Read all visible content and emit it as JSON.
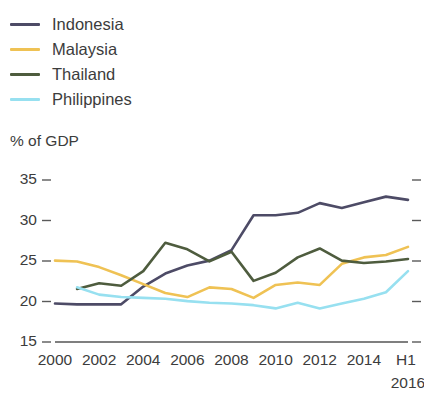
{
  "legend": {
    "position": "top-left",
    "items": [
      {
        "label": "Indonesia",
        "color": "#4d4b66",
        "icon": "line-swatch-icon"
      },
      {
        "label": "Malaysia",
        "color": "#efc254",
        "icon": "line-swatch-icon"
      },
      {
        "label": "Thailand",
        "color": "#4e5c3e",
        "icon": "line-swatch-icon"
      },
      {
        "label": "Philippines",
        "color": "#97e0f0",
        "icon": "line-swatch-icon"
      }
    ]
  },
  "axis": {
    "y_title": "% of GDP",
    "y_ticks": [
      "35",
      "30",
      "25",
      "20",
      "15"
    ],
    "x_ticks": [
      "2000",
      "2002",
      "2004",
      "2006",
      "2008",
      "2010",
      "2012",
      "2014",
      "H1"
    ],
    "x_last_sublabel": "2016"
  },
  "chart_data": {
    "type": "line",
    "title": "",
    "subtitle": "",
    "xlabel": "",
    "ylabel": "% of GDP",
    "ylim": [
      15,
      35
    ],
    "xlim": [
      2000,
      2016
    ],
    "grid": false,
    "legend_position": "top-left",
    "x": [
      2000,
      2001,
      2002,
      2003,
      2004,
      2005,
      2006,
      2007,
      2008,
      2009,
      2010,
      2011,
      2012,
      2013,
      2014,
      2015,
      2016
    ],
    "x_tick_labels": [
      "2000",
      "2002",
      "2004",
      "2006",
      "2008",
      "2010",
      "2012",
      "2014",
      "H1 2016"
    ],
    "series": [
      {
        "name": "Indonesia",
        "color": "#4d4b66",
        "x": [
          2000,
          2001,
          2002,
          2003,
          2004,
          2005,
          2006,
          2007,
          2008,
          2009,
          2010,
          2011,
          2012,
          2013,
          2014,
          2015,
          2016
        ],
        "values": [
          19.5,
          19.4,
          19.4,
          19.4,
          21.6,
          23.2,
          24.2,
          24.8,
          26.1,
          30.4,
          30.4,
          30.7,
          31.9,
          31.3,
          32.0,
          32.7,
          32.3
        ]
      },
      {
        "name": "Malaysia",
        "color": "#efc254",
        "x": [
          2000,
          2001,
          2002,
          2003,
          2004,
          2005,
          2006,
          2007,
          2008,
          2009,
          2010,
          2011,
          2012,
          2013,
          2014,
          2015,
          2016
        ],
        "values": [
          24.8,
          24.7,
          24.0,
          23.0,
          21.9,
          20.8,
          20.3,
          21.5,
          21.3,
          20.2,
          21.8,
          22.1,
          21.8,
          24.4,
          25.2,
          25.5,
          26.5
        ]
      },
      {
        "name": "Thailand",
        "color": "#4e5c3e",
        "x": [
          2001,
          2002,
          2003,
          2004,
          2005,
          2006,
          2007,
          2008,
          2009,
          2010,
          2011,
          2012,
          2013,
          2014,
          2015,
          2016
        ],
        "values": [
          21.3,
          22.0,
          21.7,
          23.5,
          27.0,
          26.2,
          24.7,
          25.9,
          22.3,
          23.3,
          25.2,
          26.3,
          24.8,
          24.5,
          24.7,
          25.0
        ]
      },
      {
        "name": "Philippines",
        "color": "#97e0f0",
        "x": [
          2001,
          2002,
          2003,
          2004,
          2005,
          2006,
          2007,
          2008,
          2009,
          2010,
          2011,
          2012,
          2013,
          2014,
          2015,
          2016
        ],
        "values": [
          21.5,
          20.6,
          20.3,
          20.2,
          20.1,
          19.8,
          19.6,
          19.5,
          19.3,
          18.9,
          19.6,
          18.9,
          19.5,
          20.1,
          20.9,
          23.5
        ]
      }
    ]
  }
}
